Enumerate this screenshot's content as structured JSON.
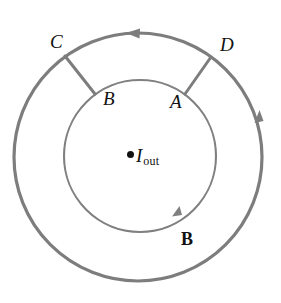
{
  "figure": {
    "background_color": "#ffffff",
    "width": 281,
    "height": 303,
    "stroke_color": "#7a7a7a",
    "label_color": "#111111",
    "outer_circle": {
      "name": "outer-amperian-loop",
      "cx": 138,
      "cy": 157,
      "r": 124,
      "stroke_width": 3.2,
      "direction": "counterclockwise"
    },
    "inner_circle": {
      "name": "inner-amperian-loop",
      "cx": 140,
      "cy": 156,
      "r": 76,
      "stroke_width": 2.2,
      "direction": "counterclockwise"
    },
    "radial_segments": [
      {
        "name": "segment-C-to-B",
        "from": "C",
        "to": "B",
        "angle_deg": 126
      },
      {
        "name": "segment-D-to-A",
        "from": "D",
        "to": "A",
        "angle_deg": 54
      }
    ],
    "arrowheads": [
      {
        "name": "outer-loop-top-arrow",
        "on": "outer_circle",
        "angle_deg": 97,
        "points": "counterclockwise"
      },
      {
        "name": "outer-loop-right-arrow",
        "on": "outer_circle",
        "angle_deg": 11,
        "points": "counterclockwise"
      },
      {
        "name": "inner-loop-bottom-arrow",
        "on": "inner_circle",
        "angle_deg": -60,
        "points": "counterclockwise"
      }
    ]
  },
  "labels": {
    "point_c": "C",
    "point_d": "D",
    "point_b": "B",
    "point_a": "A",
    "field_vector": "B",
    "current_symbol": "I",
    "current_subscript": "out"
  }
}
